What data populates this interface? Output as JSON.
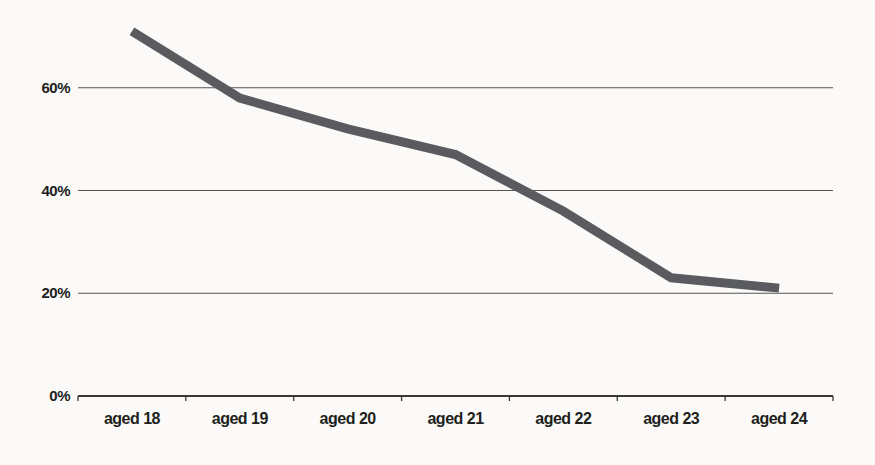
{
  "chart_data": {
    "type": "line",
    "title": "",
    "xlabel": "",
    "ylabel": "",
    "categories": [
      "aged 18",
      "aged 19",
      "aged 20",
      "aged 21",
      "aged 22",
      "aged 23",
      "aged 24"
    ],
    "values": [
      71,
      58,
      52,
      47,
      36,
      23,
      21
    ],
    "unit": "%",
    "ylim": [
      0,
      77
    ],
    "yticks": [
      0,
      20,
      40,
      60
    ],
    "ytick_labels": [
      "0%",
      "20%",
      "40%",
      "60%"
    ],
    "grid": "horizontal",
    "legend": "none",
    "line_style": "thick-solid-no-markers"
  },
  "colors": {
    "background": "#fbfaf8",
    "line": "#595b5e",
    "gridline": "#565350",
    "axis": "#3b3936",
    "text": "#211f1c"
  }
}
